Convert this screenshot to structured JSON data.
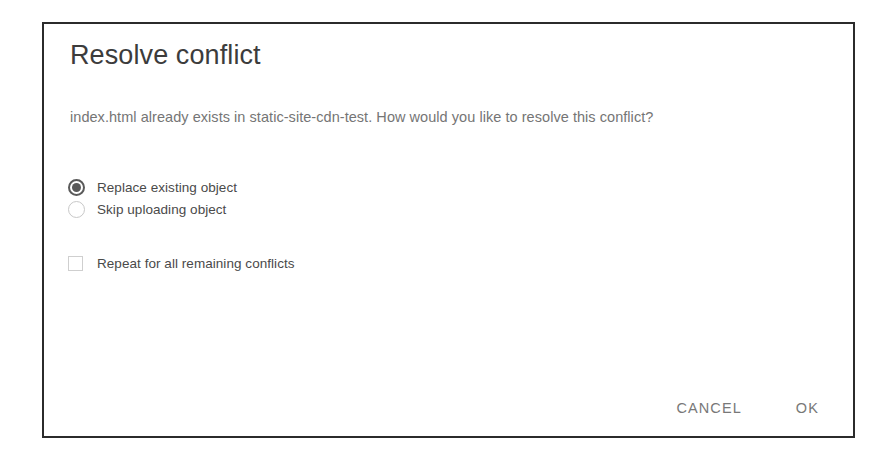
{
  "dialog": {
    "title": "Resolve conflict",
    "message": "index.html already exists in static-site-cdn-test. How would you like to resolve this conflict?",
    "options": [
      {
        "label": "Replace existing object",
        "selected": true
      },
      {
        "label": "Skip uploading object",
        "selected": false
      }
    ],
    "checkbox": {
      "label": "Repeat for all remaining conflicts",
      "checked": false
    },
    "actions": {
      "cancel_label": "CANCEL",
      "ok_label": "OK"
    },
    "colors": {
      "border": "#2b2b2b",
      "title_text": "#3c3c3c",
      "body_text": "#757575",
      "option_text": "#4a4a4a",
      "control": "#5a5a5a",
      "action_text": "#787878",
      "background": "#ffffff"
    }
  }
}
